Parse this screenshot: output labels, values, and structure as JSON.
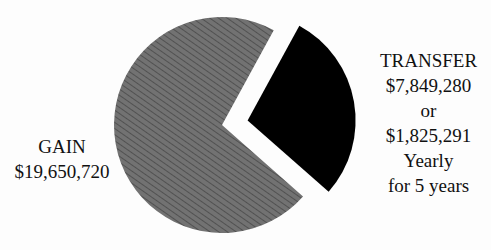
{
  "chart_data": {
    "type": "pie",
    "title": "",
    "slices": [
      {
        "label": "GAIN",
        "value": 19650720,
        "display": "$19,650,720",
        "pattern": "diagonal-hatch",
        "color": "#6e6e6e"
      },
      {
        "label": "TRANSFER",
        "value": 7849280,
        "display": "$7,849,280",
        "note": "or $1,825,291 Yearly for 5 years",
        "pattern": "solid",
        "color": "#000000",
        "exploded": true
      }
    ],
    "total": 27500000,
    "legend": "none (direct labels)"
  },
  "labels": {
    "gain": {
      "line1": "GAIN",
      "line2": "$19,650,720"
    },
    "transfer": {
      "line1": "TRANSFER",
      "line2": "$7,849,280",
      "line3": "or",
      "line4": "$1,825,291",
      "line5": "Yearly",
      "line6": "for 5 years"
    }
  },
  "colors": {
    "gain_fill": "#6e6e6e",
    "gain_hatch": "#3a3a3a",
    "transfer_fill": "#000000",
    "background": "#fdfdfd"
  }
}
